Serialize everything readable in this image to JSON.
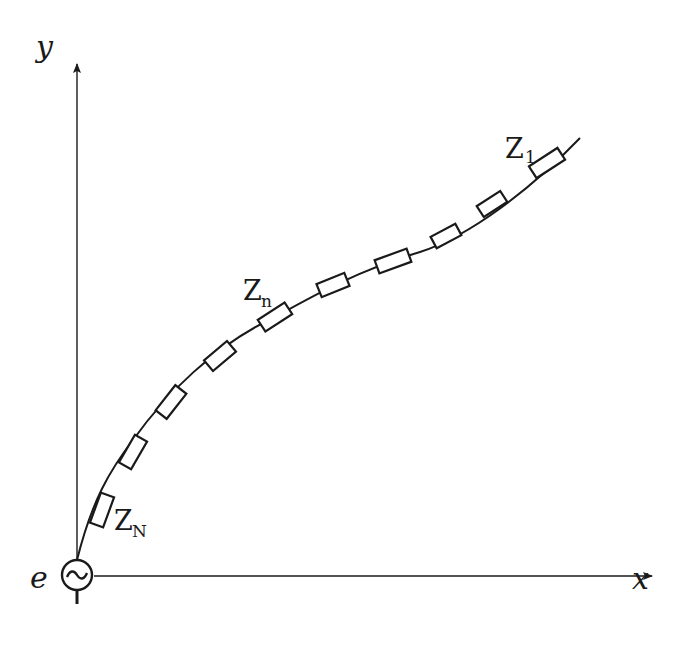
{
  "diagram": {
    "type": "circuit-diagram",
    "axes": {
      "x_label": "x",
      "y_label": "y"
    },
    "source": {
      "label": "e",
      "symbol": "~",
      "icon": "ac-source-icon"
    },
    "labels": {
      "z1_main": "Z",
      "z1_sub": "1",
      "zn_main": "Z",
      "zn_sub": "n",
      "zN_main": "Z",
      "zN_sub": "N"
    },
    "elements": [
      {
        "id": "Z1",
        "cx": 547,
        "cy": 163,
        "angle": -33
      },
      {
        "id": "Z2",
        "cx": 492,
        "cy": 204,
        "angle": -33
      },
      {
        "id": "Z3",
        "cx": 446,
        "cy": 236,
        "angle": -28
      },
      {
        "id": "Z4",
        "cx": 393,
        "cy": 261,
        "angle": -20
      },
      {
        "id": "Z5",
        "cx": 333,
        "cy": 285,
        "angle": -22
      },
      {
        "id": "Z6",
        "cx": 275,
        "cy": 317,
        "angle": -33
      },
      {
        "id": "Z7",
        "cx": 220,
        "cy": 356,
        "angle": -40
      },
      {
        "id": "Z8",
        "cx": 171,
        "cy": 402,
        "angle": -52
      },
      {
        "id": "Z9",
        "cx": 133,
        "cy": 452,
        "angle": -60
      },
      {
        "id": "ZN",
        "cx": 102,
        "cy": 510,
        "angle": -70
      }
    ],
    "colors": {
      "line": "#1a1a1a",
      "background": "#ffffff"
    }
  }
}
